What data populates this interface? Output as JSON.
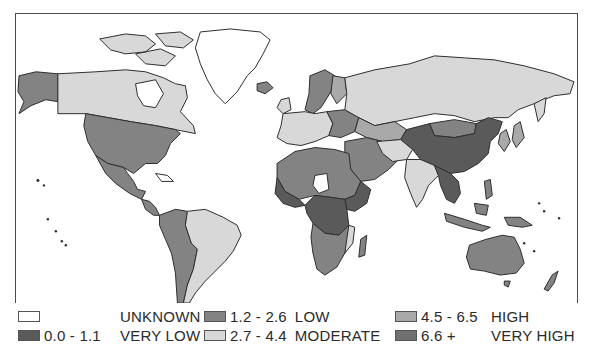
{
  "map": {
    "type": "choropleth-world",
    "frame": {
      "stroke": "#4a4a4a"
    },
    "regions": [
      {
        "name": "Alaska",
        "class": "low"
      },
      {
        "name": "Canada",
        "class": "moderate"
      },
      {
        "name": "United States",
        "class": "low"
      },
      {
        "name": "Mexico",
        "class": "low"
      },
      {
        "name": "Greenland",
        "class": "unknown"
      },
      {
        "name": "Central America",
        "class": "low"
      },
      {
        "name": "Colombia/Peru/Bolivia",
        "class": "low"
      },
      {
        "name": "Brazil/Argentina",
        "class": "moderate"
      },
      {
        "name": "Scandinavia",
        "class": "low"
      },
      {
        "name": "Western Europe",
        "class": "moderate"
      },
      {
        "name": "Russia",
        "class": "moderate"
      },
      {
        "name": "Mongolia",
        "class": "low"
      },
      {
        "name": "China",
        "class": "very_low"
      },
      {
        "name": "India",
        "class": "moderate"
      },
      {
        "name": "Southeast Asia",
        "class": "very_low"
      },
      {
        "name": "North Africa",
        "class": "low"
      },
      {
        "name": "Central Africa",
        "class": "very_low"
      },
      {
        "name": "Southern Africa",
        "class": "low"
      },
      {
        "name": "Australia",
        "class": "low"
      },
      {
        "name": "New Zealand",
        "class": "low"
      },
      {
        "name": "Madagascar",
        "class": "low"
      }
    ]
  },
  "legend": {
    "items": [
      {
        "range": "",
        "label": "UNKNOWN",
        "color": "#ffffff"
      },
      {
        "range": "0.0 - 1.1",
        "label": "VERY LOW",
        "color": "#5a5a5a"
      },
      {
        "range": "1.2 - 2.6",
        "label": "LOW",
        "color": "#838383"
      },
      {
        "range": "2.7 - 4.4",
        "label": "MODERATE",
        "color": "#d8d8d8"
      },
      {
        "range": "4.5 - 6.5",
        "label": "HIGH",
        "color": "#a9a9a9"
      },
      {
        "range": "6.6 +",
        "label": "VERY HIGH",
        "color": "#707070"
      }
    ]
  },
  "colors": {
    "unknown": "#ffffff",
    "very_low": "#5a5a5a",
    "low": "#838383",
    "moderate": "#d8d8d8",
    "high": "#a9a9a9",
    "very_high": "#707070",
    "border": "#2e2e2e"
  }
}
